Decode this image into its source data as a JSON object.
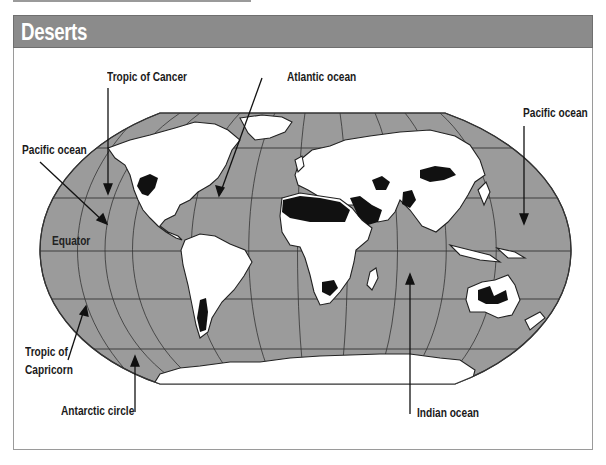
{
  "header": {
    "title": "Deserts",
    "bar_color": "#8b8b8b"
  },
  "map": {
    "projection": "Robinson world map",
    "ocean_color": "#9b9b9b",
    "land_color": "#ffffff",
    "desert_color": "#111111",
    "graticule_lines": [
      "Arctic circle",
      "Tropic of Cancer",
      "Equator",
      "Tropic of Capricorn",
      "Antarctic circle"
    ]
  },
  "labels": {
    "tropic_of_cancer": "Tropic of Cancer",
    "atlantic_ocean": "Atlantic ocean",
    "pacific_ocean_left": "Pacific ocean",
    "pacific_ocean_right": "Pacific ocean",
    "equator": "Equator",
    "tropic_of_capricorn_line1": "Tropic of",
    "tropic_of_capricorn_line2": "Capricorn",
    "antarctic_circle": "Antarctic circle",
    "indian_ocean": "Indian ocean"
  },
  "deserts": [
    "North American deserts",
    "Atacama / Patagonian desert",
    "Sahara",
    "Arabian desert",
    "Iranian / Thar deserts",
    "Central Asian deserts",
    "Gobi / Taklamakan",
    "Kalahari / Namib",
    "Australian deserts"
  ]
}
